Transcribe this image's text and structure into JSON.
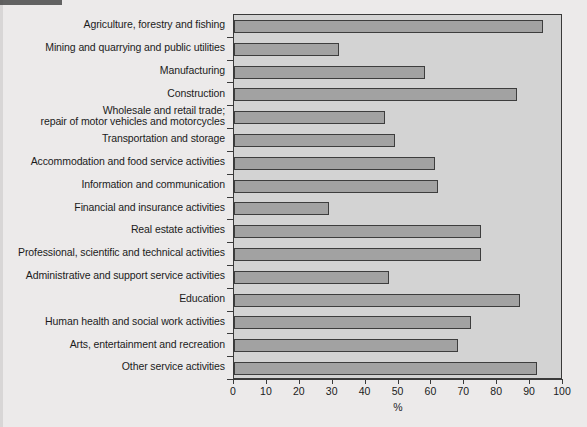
{
  "chart_data": {
    "type": "bar",
    "orientation": "horizontal",
    "title": "",
    "xlabel": "%",
    "ylabel": "",
    "xlim": [
      0,
      100
    ],
    "xticks": [
      0,
      10,
      20,
      30,
      40,
      50,
      60,
      70,
      80,
      90,
      100
    ],
    "grid": false,
    "legend": null,
    "categories": [
      "Agriculture, forestry and fishing",
      "Mining and quarrying and public utilities",
      "Manufacturing",
      "Construction",
      "Wholesale and retail trade;\nrepair of motor vehicles and motorcycles",
      "Transportation and storage",
      "Accommodation and food service activities",
      "Information and communication",
      "Financial and insurance activities",
      "Real estate activities",
      "Professional, scientific and technical activities",
      "Administrative and support service activities",
      "Education",
      "Human health and social work activities",
      "Arts, entertainment and recreation",
      "Other service activities"
    ],
    "values": [
      94,
      32,
      58,
      86,
      46,
      49,
      61,
      62,
      29,
      75,
      75,
      47,
      87,
      72,
      68,
      92
    ],
    "colors": {
      "bar_fill": "#a2a2a2",
      "bar_border": "#3d3d3d",
      "plot_background": "#d3d3d3",
      "page_background": "#eceaea",
      "axis": "#3a3a3a",
      "text": "#1b1b1b"
    }
  }
}
